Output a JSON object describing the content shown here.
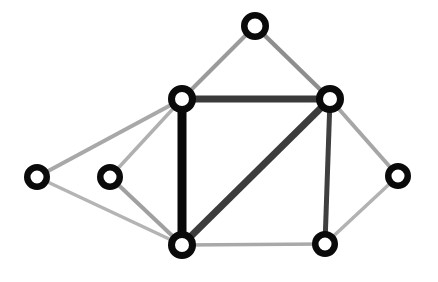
{
  "figure": {
    "background_color": "#ffffff",
    "width": 438,
    "height": 282
  },
  "chart_data": {
    "type": "diagram",
    "subtype": "node-link-graph",
    "title": "",
    "xlabel": "",
    "ylabel": "",
    "legend": [],
    "node_style": {
      "shape": "circle",
      "fill_color": "#ffffff",
      "stroke_color": "#0a0a0a",
      "radius": 14,
      "stroke_width": 6
    },
    "nodes": [
      {
        "id": "n-top",
        "label": "",
        "x": 255,
        "y": 26,
        "r": 14,
        "stroke_width": 6.5
      },
      {
        "id": "n-left-outer",
        "label": "",
        "x": 37,
        "y": 177,
        "r": 13,
        "stroke_width": 6.5
      },
      {
        "id": "n-left-inner",
        "label": "",
        "x": 110,
        "y": 177,
        "r": 13,
        "stroke_width": 6.5
      },
      {
        "id": "n-hub-upper-left",
        "label": "",
        "x": 182,
        "y": 99,
        "r": 14,
        "stroke_width": 7
      },
      {
        "id": "n-hub-upper-right",
        "label": "",
        "x": 330,
        "y": 99,
        "r": 14,
        "stroke_width": 7
      },
      {
        "id": "n-hub-lower-left",
        "label": "",
        "x": 182,
        "y": 245,
        "r": 14,
        "stroke_width": 7
      },
      {
        "id": "n-hub-lower-right",
        "label": "",
        "x": 325,
        "y": 244,
        "r": 13,
        "stroke_width": 6.5
      },
      {
        "id": "n-right-outer",
        "label": "",
        "x": 398,
        "y": 176,
        "r": 13,
        "stroke_width": 6.5
      }
    ],
    "edges": [
      {
        "id": "e-topleft",
        "source": "n-top",
        "target": "n-hub-upper-left",
        "color": "#9b9b9b",
        "width": 4,
        "weight_class": "light"
      },
      {
        "id": "e-topright",
        "source": "n-top",
        "target": "n-hub-upper-right",
        "color": "#8e8e8e",
        "width": 4.5,
        "weight_class": "light"
      },
      {
        "id": "e-outer-up",
        "source": "n-left-outer",
        "target": "n-hub-upper-left",
        "color": "#a8a8a8",
        "width": 4,
        "weight_class": "light"
      },
      {
        "id": "e-outer-down",
        "source": "n-left-outer",
        "target": "n-hub-lower-left",
        "color": "#b4b4b4",
        "width": 3.5,
        "weight_class": "light"
      },
      {
        "id": "e-inner-up",
        "source": "n-left-inner",
        "target": "n-hub-upper-left",
        "color": "#b0b0b0",
        "width": 3.5,
        "weight_class": "light"
      },
      {
        "id": "e-inner-down",
        "source": "n-left-inner",
        "target": "n-hub-lower-left",
        "color": "#a0a0a0",
        "width": 4,
        "weight_class": "light"
      },
      {
        "id": "e-top-horizontal",
        "source": "n-hub-upper-left",
        "target": "n-hub-upper-right",
        "color": "#3a3a3a",
        "width": 7,
        "weight_class": "heavy"
      },
      {
        "id": "e-left-vertical",
        "source": "n-hub-upper-left",
        "target": "n-hub-lower-left",
        "color": "#080808",
        "width": 9,
        "weight_class": "heaviest"
      },
      {
        "id": "e-diagonal",
        "source": "n-hub-upper-right",
        "target": "n-hub-lower-left",
        "color": "#3c3c3c",
        "width": 7,
        "weight_class": "heavy"
      },
      {
        "id": "e-right-vertical",
        "source": "n-hub-upper-right",
        "target": "n-hub-lower-right",
        "color": "#3f3f3f",
        "width": 5,
        "weight_class": "medium"
      },
      {
        "id": "e-bottom-horizontal",
        "source": "n-hub-lower-left",
        "target": "n-hub-lower-right",
        "color": "#a9a9a9",
        "width": 3.5,
        "weight_class": "light"
      },
      {
        "id": "e-right-up",
        "source": "n-right-outer",
        "target": "n-hub-upper-right",
        "color": "#a6a6a6",
        "width": 4,
        "weight_class": "light"
      },
      {
        "id": "e-right-down",
        "source": "n-right-outer",
        "target": "n-hub-lower-right",
        "color": "#b2b2b2",
        "width": 3.5,
        "weight_class": "light"
      }
    ]
  }
}
